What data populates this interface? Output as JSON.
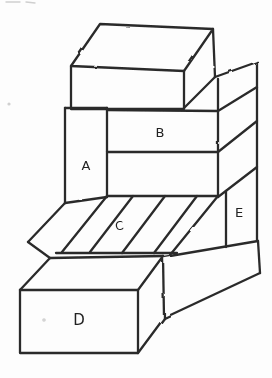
{
  "diagram": {
    "labels": [
      {
        "id": "A",
        "text": "A"
      },
      {
        "id": "B",
        "text": "B"
      },
      {
        "id": "C",
        "text": "C"
      },
      {
        "id": "D",
        "text": "D"
      },
      {
        "id": "E",
        "text": "E"
      }
    ],
    "colors": {
      "stroke": "#2b2b2b",
      "background": "#fdfdfd",
      "label": "#222222"
    }
  }
}
